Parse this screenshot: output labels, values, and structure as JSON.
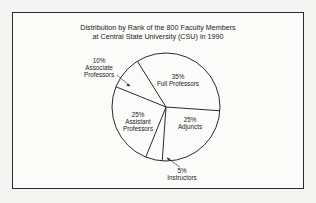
{
  "chart_data": {
    "type": "pie",
    "title": "Distribution by Rank of the 800 Faculty Members at Central State University (CSU) in 1990",
    "title_lines": [
      "Distribution by Rank of the 800 Faculty Members",
      "at Central State University (CSU) in 1990"
    ],
    "total": 800,
    "categories": [
      "Full Professors",
      "Adjuncts",
      "Instructors",
      "Assistant Professors",
      "Associate Professors"
    ],
    "values": [
      35,
      25,
      5,
      25,
      10
    ],
    "unit": "%",
    "labels": [
      {
        "pct": "35%",
        "name": "Full Professors"
      },
      {
        "pct": "25%",
        "name": "Adjuncts"
      },
      {
        "pct": "5%",
        "name": "Instructors"
      },
      {
        "pct": "25%",
        "name": [
          "Assistant",
          "Professors"
        ]
      },
      {
        "pct": "10%",
        "name": [
          "Associate",
          "Professors"
        ]
      }
    ],
    "legend": "none",
    "colors": {
      "fill": "#fbfbfa",
      "stroke": "#2a2a2a"
    }
  }
}
